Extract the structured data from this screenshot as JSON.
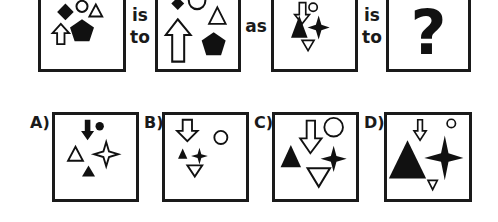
{
  "puzzle": {
    "type": "figure-analogy",
    "connector_is": "is",
    "connector_to": "to",
    "connector_as": "as",
    "unknown": "?",
    "top_row": [
      {
        "id": "figure-1",
        "shapes": [
          "black-diamond",
          "white-circle",
          "white-triangle",
          "white-up-arrow",
          "black-pentagon"
        ]
      },
      {
        "id": "figure-2",
        "shapes": [
          "black-diamond",
          "white-circle",
          "white-triangle",
          "white-up-arrow-large",
          "black-pentagon"
        ]
      },
      {
        "id": "figure-3",
        "shapes": [
          "white-down-arrow",
          "white-circle",
          "black-triangle",
          "black-four-point-star",
          "white-down-triangle"
        ]
      },
      {
        "id": "figure-4",
        "shapes": [
          "question-mark"
        ]
      }
    ],
    "options": [
      {
        "label": "A)",
        "shapes": [
          "black-down-arrow",
          "black-circle",
          "white-triangle",
          "white-four-point-star",
          "black-triangle"
        ]
      },
      {
        "label": "B)",
        "shapes": [
          "white-down-arrow",
          "white-circle",
          "black-triangle",
          "black-four-point-star",
          "white-down-triangle"
        ]
      },
      {
        "label": "C)",
        "shapes": [
          "white-down-arrow-large",
          "white-circle",
          "black-triangle",
          "black-four-point-star",
          "white-down-triangle-large"
        ]
      },
      {
        "label": "D)",
        "shapes": [
          "white-down-arrow",
          "white-circle-small",
          "black-triangle-large",
          "black-four-point-star-large",
          "white-down-triangle-small"
        ]
      }
    ]
  },
  "colors": {
    "ink": "#1a1a1a",
    "background": "#ffffff"
  }
}
